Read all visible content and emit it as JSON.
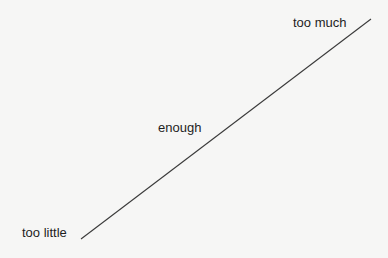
{
  "diagram": {
    "line": {
      "x1": 81,
      "y1": 239,
      "x2": 371,
      "y2": 19,
      "color": "#3a3a3a"
    },
    "labels": {
      "low": "too little",
      "mid": "enough",
      "high": "too much"
    }
  }
}
